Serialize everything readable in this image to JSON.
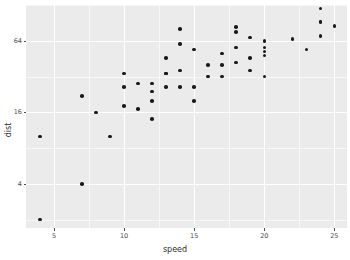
{
  "chart_data": {
    "type": "scatter",
    "title": "",
    "xlabel": "speed",
    "ylabel": "dist",
    "xlim": [
      3.0,
      25.9
    ],
    "ylim": [
      1.7,
      128
    ],
    "yscale": "log2",
    "xticks": [
      5,
      10,
      15,
      20,
      25
    ],
    "xtick_labels": [
      "5",
      "10",
      "15",
      "20",
      "25"
    ],
    "yticks": [
      4,
      16,
      64
    ],
    "ytick_labels": [
      "4",
      "16",
      "64"
    ],
    "grid": true,
    "minor_grid": true,
    "legend": "none",
    "point_color": "#1a1a1a",
    "panel_background": "#ebebeb",
    "grid_color": "#ffffff",
    "x": [
      4,
      4,
      7,
      7,
      8,
      9,
      10,
      10,
      10,
      11,
      11,
      12,
      12,
      12,
      12,
      13,
      13,
      13,
      13,
      14,
      14,
      14,
      14,
      15,
      15,
      15,
      16,
      16,
      17,
      17,
      17,
      18,
      18,
      18,
      18,
      19,
      19,
      19,
      20,
      20,
      20,
      20,
      20,
      22,
      23,
      24,
      24,
      24,
      24,
      25
    ],
    "y": [
      2,
      10,
      4,
      22,
      16,
      10,
      18,
      26,
      34,
      17,
      28,
      14,
      20,
      24,
      28,
      26,
      34,
      34,
      46,
      26,
      36,
      60,
      80,
      20,
      26,
      54,
      32,
      40,
      32,
      40,
      50,
      42,
      56,
      76,
      84,
      36,
      46,
      68,
      32,
      48,
      52,
      56,
      64,
      66,
      54,
      70,
      92,
      93,
      120,
      85
    ],
    "n_points": 50
  },
  "axis": {
    "x_title": "speed",
    "y_title": "dist"
  }
}
